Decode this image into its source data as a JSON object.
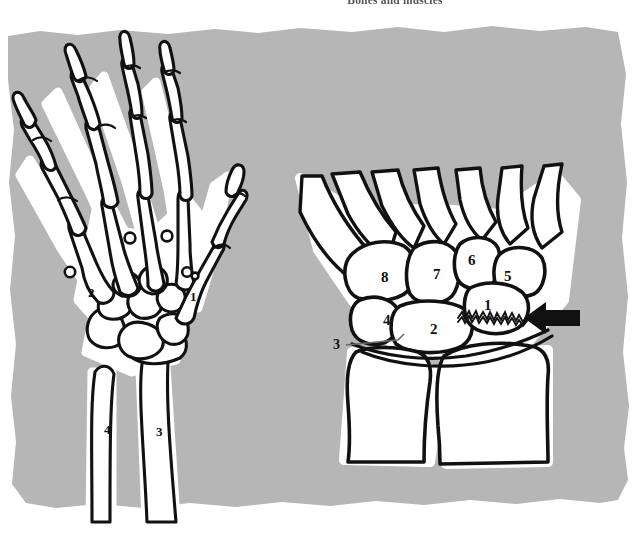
{
  "page": {
    "running_head": "Bones and muscles",
    "background_color": "#ffffff",
    "plate_color": "#b6b6b6",
    "bone_fill": "#ffffff",
    "outline_color": "#111111",
    "halo_color": "#ffffff",
    "width": 642,
    "height": 548
  },
  "figures": [
    {
      "id": "hand-skeleton-dorsal",
      "name": "left-hand-skeleton",
      "description": "Dorsal view of the bones of the hand, wrist and distal forearm",
      "labels": [
        {
          "text": "1",
          "x": 190,
          "y": 297,
          "target": "thumb-metacarpal"
        },
        {
          "text": "2",
          "x": 88,
          "y": 293,
          "target": "index-metacarpal"
        },
        {
          "text": "3",
          "x": 156,
          "y": 432,
          "target": "radius"
        },
        {
          "text": "4",
          "x": 104,
          "y": 430,
          "target": "ulna"
        }
      ]
    },
    {
      "id": "carpus-detail",
      "name": "carpal-bones-detail",
      "description": "Magnified view of the carpal bones showing a fracture of bone 1",
      "labels": [
        {
          "text": "1",
          "x": 484,
          "y": 305,
          "target": "scaphoid"
        },
        {
          "text": "2",
          "x": 432,
          "y": 330,
          "target": "capitate"
        },
        {
          "text": "3",
          "x": 337,
          "y": 345,
          "target": "pisiform",
          "leader": true
        },
        {
          "text": "4",
          "x": 385,
          "y": 320,
          "target": "hamate"
        },
        {
          "text": "5",
          "x": 504,
          "y": 277,
          "target": "trapezium"
        },
        {
          "text": "6",
          "x": 468,
          "y": 261,
          "target": "trapezoid"
        },
        {
          "text": "7",
          "x": 435,
          "y": 275,
          "target": "lunate"
        },
        {
          "text": "8",
          "x": 383,
          "y": 278,
          "target": "triquetral"
        }
      ],
      "annotations": [
        {
          "type": "arrow",
          "name": "fracture-arrow",
          "direction": "left",
          "x": 508,
          "y": 318
        },
        {
          "type": "fracture-line",
          "name": "scaphoid-fracture",
          "x": 458,
          "y": 317
        }
      ]
    }
  ]
}
